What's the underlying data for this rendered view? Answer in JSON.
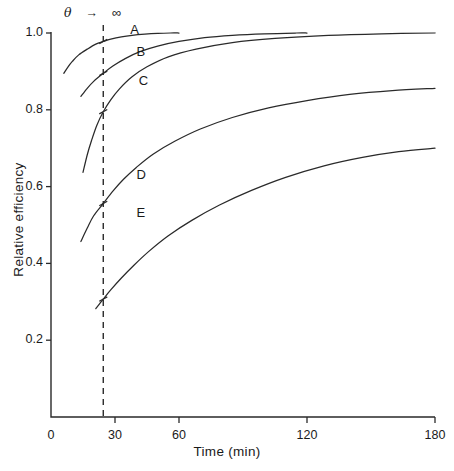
{
  "chart_data": {
    "type": "line",
    "title": "",
    "xlabel": "Time (min)",
    "ylabel": "Relative efficiency",
    "xlim": [
      0,
      180
    ],
    "ylim": [
      0,
      1.04
    ],
    "grid": false,
    "legend": "inline-curve-labels",
    "xticks": [
      0,
      30,
      60,
      120,
      180
    ],
    "xticklabels": [
      "0",
      "30",
      "60",
      "120",
      "180"
    ],
    "yticks": [
      0.2,
      0.4,
      0.6,
      0.8,
      1.0
    ],
    "yticklabels": [
      "0.2",
      "0.4",
      "0.6",
      "0.8",
      "1.0"
    ],
    "annotations": [
      {
        "name": "limit-annotation",
        "text": "θ   →   ∞",
        "theta": "θ",
        "arrow": "→",
        "infinity": "∞"
      },
      {
        "name": "vertical-reference-line",
        "style": "dashed",
        "x": 24.5,
        "label": ""
      }
    ],
    "series": [
      {
        "name": "A",
        "label": "A",
        "label_x": 39,
        "label_y": 1.005,
        "x": [
          6,
          8,
          10,
          13,
          17,
          21,
          24.5,
          28,
          33,
          38,
          44,
          50,
          56,
          60
        ],
        "y": [
          0.895,
          0.912,
          0.926,
          0.943,
          0.958,
          0.971,
          0.978,
          0.984,
          0.99,
          0.994,
          0.997,
          0.999,
          1.0,
          1.0
        ]
      },
      {
        "name": "B",
        "label": "B",
        "label_x": 42,
        "label_y": 0.948,
        "x": [
          14,
          17,
          20,
          24.5,
          29,
          35,
          42,
          50,
          60,
          72,
          85,
          100,
          115,
          120
        ],
        "y": [
          0.835,
          0.856,
          0.874,
          0.895,
          0.914,
          0.934,
          0.952,
          0.966,
          0.978,
          0.988,
          0.994,
          0.998,
          1.0,
          1.0
        ]
      },
      {
        "name": "C",
        "label": "C",
        "label_x": 43,
        "label_y": 0.872,
        "x": [
          15,
          17,
          19,
          21.5,
          24.5,
          28,
          32,
          38,
          45,
          55,
          68,
          85,
          105,
          130,
          155,
          180
        ],
        "y": [
          0.637,
          0.683,
          0.72,
          0.76,
          0.795,
          0.826,
          0.854,
          0.886,
          0.912,
          0.938,
          0.958,
          0.975,
          0.986,
          0.994,
          0.998,
          1.0
        ]
      },
      {
        "name": "D",
        "label": "D",
        "label_x": 42,
        "label_y": 0.628,
        "x": [
          14,
          17,
          20,
          24.5,
          29,
          34,
          40,
          48,
          58,
          70,
          85,
          102,
          120,
          140,
          160,
          180
        ],
        "y": [
          0.457,
          0.492,
          0.524,
          0.556,
          0.588,
          0.619,
          0.65,
          0.685,
          0.718,
          0.75,
          0.78,
          0.805,
          0.824,
          0.84,
          0.85,
          0.856
        ]
      },
      {
        "name": "E",
        "label": "E",
        "label_x": 42,
        "label_y": 0.528,
        "x": [
          21,
          24.5,
          28,
          33,
          39,
          46,
          55,
          66,
          79,
          94,
          110,
          128,
          146,
          163,
          180
        ],
        "y": [
          0.282,
          0.307,
          0.331,
          0.362,
          0.396,
          0.432,
          0.472,
          0.512,
          0.552,
          0.59,
          0.624,
          0.654,
          0.676,
          0.691,
          0.7
        ]
      }
    ]
  },
  "style": {
    "axis_color": "#2a2a2a",
    "curve_color": "#2a2a2a",
    "background": "#ffffff"
  }
}
